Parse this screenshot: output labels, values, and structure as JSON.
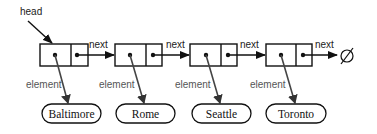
{
  "diagram": {
    "type": "singly-linked-list",
    "head_label": "head",
    "next_label": "next",
    "element_label": "element",
    "null_symbol": "∅",
    "nodes": [
      {
        "element": "Baltimore"
      },
      {
        "element": "Rome"
      },
      {
        "element": "Seattle"
      },
      {
        "element": "Toronto"
      }
    ]
  }
}
